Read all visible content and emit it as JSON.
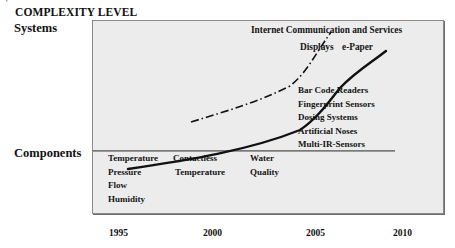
{
  "diagram": {
    "title": "COMPLEXITY LEVEL",
    "y_levels": {
      "top": "Systems",
      "bottom": "Components"
    },
    "x_axis": {
      "ticks": [
        "1995",
        "2000",
        "2005",
        "2010"
      ]
    },
    "upper_labels": {
      "internet": "Internet Communication and Services",
      "displays": "Displays",
      "epaper": "e-Paper"
    },
    "system_applications": [
      "Bar Code Readers",
      "Fingerprint Sensors",
      "Dosing Systems",
      "Artificial Noses",
      "Multi-IR-Sensors"
    ],
    "component_columns": [
      {
        "items": [
          "Temperature",
          "Pressure",
          "Flow",
          "Humidity"
        ]
      },
      {
        "items": [
          "Contactless",
          "Temperature"
        ]
      },
      {
        "items": [
          "Water",
          "Quality"
        ]
      }
    ],
    "curves": [
      {
        "name": "solid-trend",
        "style": "solid",
        "ends_at": "e-Paper"
      },
      {
        "name": "dash-dot-trend",
        "style": "dash-dot",
        "ends_at": "Internet Communication and Services"
      }
    ],
    "colors": {
      "plot_background": "#ececec",
      "plot_border": "#8a8a8a",
      "line": "#111111"
    }
  }
}
